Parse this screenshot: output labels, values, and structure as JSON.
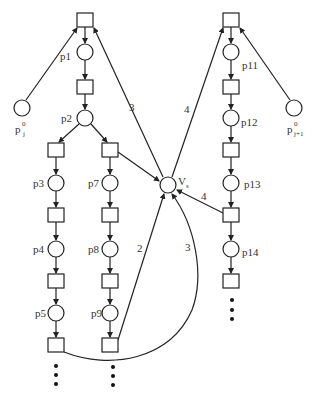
{
  "diagram": {
    "type": "petri-net",
    "colors": {
      "stroke": "#222222",
      "text": "#333333",
      "background": "#ffffff"
    },
    "places": [
      {
        "id": "p1",
        "label": "p1"
      },
      {
        "id": "p2",
        "label": "p2"
      },
      {
        "id": "p3",
        "label": "p3"
      },
      {
        "id": "p4",
        "label": "p4"
      },
      {
        "id": "p5",
        "label": "p5"
      },
      {
        "id": "p7",
        "label": "p7"
      },
      {
        "id": "p8",
        "label": "p8"
      },
      {
        "id": "p9",
        "label": "p9"
      },
      {
        "id": "p11",
        "label": "p11"
      },
      {
        "id": "p12",
        "label": "p12"
      },
      {
        "id": "p13",
        "label": "p13"
      },
      {
        "id": "p14",
        "label": "p14"
      },
      {
        "id": "p0j",
        "label": "p",
        "sup": "0",
        "sub": "j"
      },
      {
        "id": "p0j1",
        "label": "p",
        "sup": "0",
        "sub": "j+1"
      },
      {
        "id": "vs",
        "label": "V",
        "sub": "s"
      }
    ],
    "weights": {
      "vs_to_left_top": "3",
      "vs_to_right_top": "4",
      "right_trans_to_vs": "4",
      "p9_trans_to_vs": "2",
      "p5_trans_to_vs": "3"
    },
    "continuation": "⋮"
  }
}
